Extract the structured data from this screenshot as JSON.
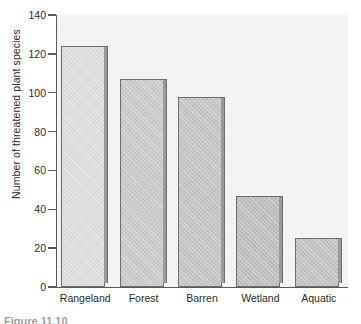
{
  "chart_data": {
    "type": "bar",
    "title": "",
    "subtitle": "",
    "xlabel": "",
    "ylabel": "Number of threatened plant species",
    "categories": [
      "Rangeland",
      "Forest",
      "Barren",
      "Wetland",
      "Aquatic"
    ],
    "values": [
      124,
      107,
      98,
      47,
      25
    ],
    "ylim": [
      0,
      140
    ],
    "yticks": [
      0,
      20,
      40,
      60,
      80,
      100,
      120,
      140
    ],
    "ytick_labels": [
      "0",
      "20",
      "40",
      "60",
      "80",
      "100",
      "120",
      "140"
    ],
    "grid": false,
    "legend": null,
    "legend_position": "none",
    "bar_colors": [
      "#dcdcda",
      "#c9c9c7",
      "#c4c4c2",
      "#bdbdbb",
      "#c2c2c0"
    ],
    "bar_edge_color": "#6d6d6d",
    "plot_background": "#f4f4f2",
    "axis_color": "#5a5a5a",
    "text_color": "#2b2b2b"
  },
  "figure": {
    "caption_fragment": "Figure 11.10"
  }
}
